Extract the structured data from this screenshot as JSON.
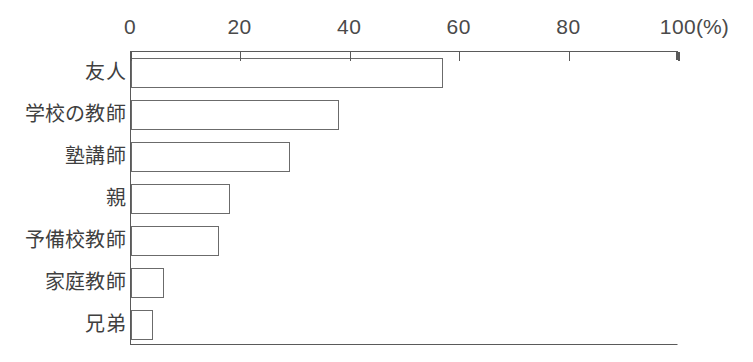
{
  "chart_data": {
    "type": "bar",
    "orientation": "horizontal",
    "title": "",
    "subtitle": "",
    "xlabel": "(%)",
    "ylabel": "",
    "unit_label": "(%)",
    "categories": [
      "友人",
      "学校の教師",
      "塾講師",
      "親",
      "予備校教師",
      "家庭教師",
      "兄弟"
    ],
    "values": [
      57,
      38,
      29,
      18,
      16,
      6,
      4
    ],
    "xlim": [
      0,
      100
    ],
    "xticks": [
      0,
      20,
      40,
      60,
      80,
      100
    ],
    "xtick_labels": [
      "0",
      "20",
      "40",
      "60",
      "80",
      "100"
    ],
    "grid": false,
    "legend": null,
    "series": [
      {
        "name": "",
        "values": [
          57,
          38,
          29,
          18,
          16,
          6,
          4
        ]
      }
    ]
  },
  "style": {
    "bar_fill": "#ffffff",
    "bar_stroke": "#6b6b6b",
    "axis_color": "#5a5a5a",
    "text_color": "#3f3f3f",
    "background": "#ffffff"
  }
}
